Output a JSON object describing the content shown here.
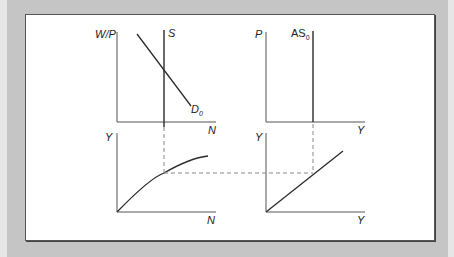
{
  "diagram": {
    "type": "four-quadrant macroeconomic model (labor market, production function, aggregate supply, 45-degree line)",
    "panels": [
      {
        "id": "labor-market",
        "y_axis_label": "W/P",
        "x_axis_label": "N",
        "curves": [
          {
            "label": "S",
            "type": "vertical",
            "desc": "labor supply"
          },
          {
            "label": "D",
            "subscript": "0",
            "type": "downward-sloping",
            "desc": "labor demand"
          }
        ]
      },
      {
        "id": "aggregate-supply",
        "y_axis_label": "P",
        "x_axis_label": "Y",
        "curves": [
          {
            "label": "AS",
            "subscript": "0",
            "type": "vertical"
          }
        ]
      },
      {
        "id": "production-function",
        "y_axis_label": "Y",
        "x_axis_label": "N",
        "curves": [
          {
            "label": "",
            "type": "concave",
            "desc": "production function Y = f(N)"
          }
        ]
      },
      {
        "id": "forty-five-degree",
        "y_axis_label": "Y",
        "x_axis_label": "Y",
        "curves": [
          {
            "label": "",
            "type": "linear-through-origin",
            "desc": "45-degree line"
          }
        ]
      }
    ],
    "connectors": [
      "dashed vertical from labor equilibrium to production function",
      "dashed horizontal from production function to 45-degree line",
      "dashed vertical from 45-degree line to AS0"
    ]
  },
  "labels": {
    "wp": "W/P",
    "s": "S",
    "d": "D",
    "d_sub": "0",
    "n_top": "N",
    "p": "P",
    "as": "AS",
    "as_sub": "0",
    "y_top": "Y",
    "y_left_bottom": "Y",
    "n_bottom": "N",
    "y_right_axis": "Y",
    "y_right_bottom": "Y"
  },
  "colors": {
    "line": "#2a2a2a",
    "axis": "#555555",
    "dash": "#888888",
    "frame": "#c5c5c5"
  }
}
